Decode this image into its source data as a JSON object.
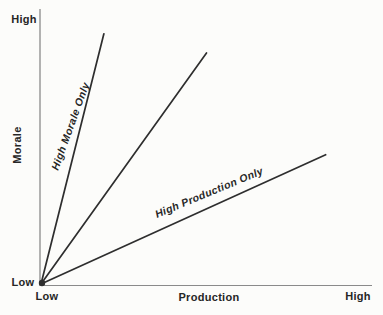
{
  "colors": {
    "background": "#fcfcfa",
    "axis": "#8a8a8a",
    "data_line": "#2e2e2e",
    "text": "#262626"
  },
  "chart_data": {
    "type": "line",
    "title": "",
    "xlabel": "Production",
    "ylabel": "Morale",
    "x_tick_labels": [
      "Low",
      "High"
    ],
    "y_tick_labels": [
      "Low",
      "High"
    ],
    "xlim": [
      0,
      1
    ],
    "ylim": [
      0,
      1
    ],
    "grid": false,
    "legend": "none",
    "annotation_note": "Three straight lines radiate from the Low/Low origin point",
    "series": [
      {
        "name": "High Morale Only",
        "x": [
          0,
          0.19
        ],
        "y": [
          0,
          0.91
        ]
      },
      {
        "name": "",
        "x": [
          0,
          0.5
        ],
        "y": [
          0,
          0.84
        ]
      },
      {
        "name": "High Production Only",
        "x": [
          0,
          0.86
        ],
        "y": [
          0,
          0.47
        ]
      }
    ]
  }
}
